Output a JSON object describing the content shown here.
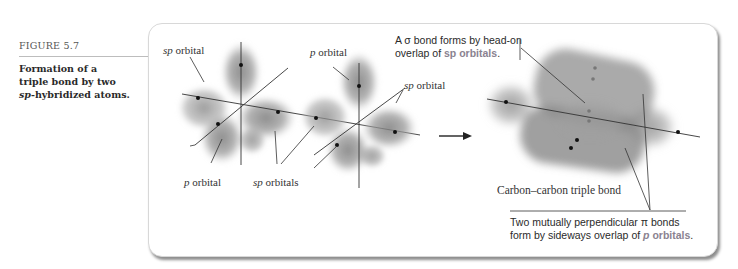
{
  "caption": {
    "figure_number": "FIGURE 5.7",
    "title_line1": "Formation of a",
    "title_line2": "triple bond by two",
    "title_line3_italic": "sp",
    "title_line3_rest": "-hybridized atoms."
  },
  "diagram": {
    "left_atom_labels": {
      "sp_orbital_top_italic": "sp",
      "sp_orbital_top_rest": " orbital",
      "p_orbital_bottom_italic": "p",
      "p_orbital_bottom_rest": " orbital",
      "sp_orbitals_italic": "sp",
      "sp_orbitals_rest": " orbitals"
    },
    "right_atom_labels": {
      "p_orbital_top_italic": "p",
      "p_orbital_top_rest": " orbital",
      "sp_orbital_right_italic": "sp",
      "sp_orbital_right_rest": " orbital"
    },
    "arrow": "reaction-arrow",
    "product_labels": {
      "sigma_line1": "A σ bond forms by head-on",
      "sigma_line2_prefix": "overlap of ",
      "sigma_line2_highlight": "sp orbitals",
      "sigma_line2_suffix": ".",
      "triple_bond": "Carbon–carbon triple bond",
      "pi_line1": "Two mutually perpendicular π bonds",
      "pi_line2_prefix": "form by sideways overlap of ",
      "pi_line2_highlight_italic": "p",
      "pi_line2_highlight": " orbitals",
      "pi_line2_suffix": "."
    },
    "colors": {
      "orbital_gray": "#8c8c8c",
      "highlight_text": "#8a8290",
      "line": "#333333"
    }
  }
}
